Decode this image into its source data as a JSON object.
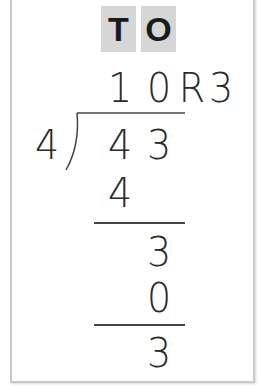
{
  "header": {
    "tens": "T",
    "ones": "O"
  },
  "quotient": {
    "tens": "1",
    "ones": "0",
    "r_label": "R",
    "remainder": "3"
  },
  "divisor": "4",
  "dividend": {
    "tens": "4",
    "ones": "3"
  },
  "steps": [
    {
      "subtract_tens": "4"
    },
    {
      "bring_down": "3"
    },
    {
      "subtract_ones": "0"
    },
    {
      "remainder": "3"
    }
  ],
  "colors": {
    "header_bg": "#d6d6d6",
    "border": "#c8c8c8",
    "ink": "#2a2a2a"
  }
}
